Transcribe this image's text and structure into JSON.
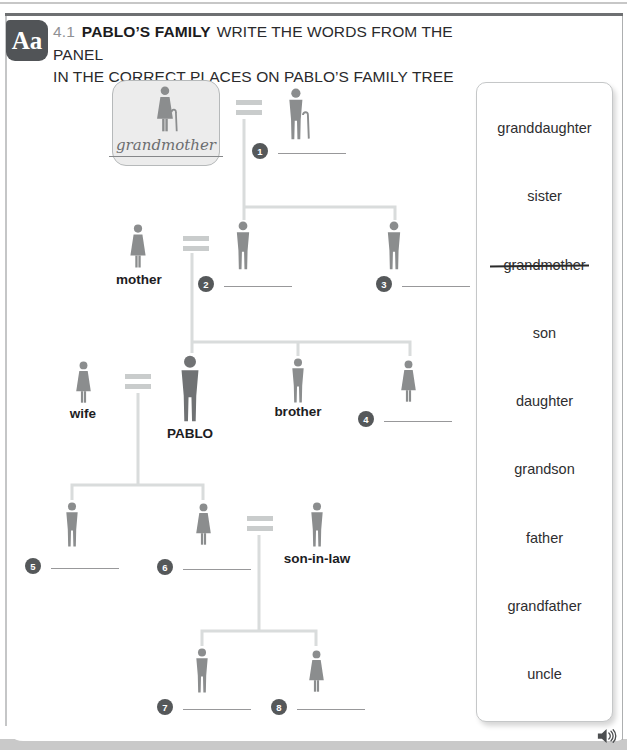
{
  "page": {
    "badge_label": "Aa",
    "exercise_number": "4.1",
    "exercise_title": "PABLO’S FAMILY",
    "instruction_line1": "WRITE THE WORDS FROM THE PANEL",
    "instruction_line2": "IN THE CORRECT PLACES ON PABLO’S FAMILY TREE"
  },
  "tree": {
    "labels": {
      "grandmother": "grandmother",
      "mother": "mother",
      "wife": "wife",
      "pablo": "PABLO",
      "brother": "brother",
      "son_in_law": "son-in-law"
    },
    "blanks": [
      {
        "number": "1"
      },
      {
        "number": "2"
      },
      {
        "number": "3"
      },
      {
        "number": "4"
      },
      {
        "number": "5"
      },
      {
        "number": "6"
      },
      {
        "number": "7"
      },
      {
        "number": "8"
      }
    ]
  },
  "panel": {
    "words": [
      {
        "text": "granddaughter",
        "crossed_out": false
      },
      {
        "text": "sister",
        "crossed_out": false
      },
      {
        "text": "grandmother",
        "crossed_out": true
      },
      {
        "text": "son",
        "crossed_out": false
      },
      {
        "text": "daughter",
        "crossed_out": false
      },
      {
        "text": "grandson",
        "crossed_out": false
      },
      {
        "text": "father",
        "crossed_out": false
      },
      {
        "text": "grandfather",
        "crossed_out": false
      },
      {
        "text": "uncle",
        "crossed_out": false
      }
    ]
  },
  "icons": {
    "audio": "speaker-icon"
  },
  "colors": {
    "section_badge_bg": "#515457",
    "figure_gray": "#8b8d8e",
    "pablo_gray": "#707274",
    "connector": "#d9dcdc",
    "number_badge": "#55585a",
    "header_rule": "#6e7072"
  }
}
